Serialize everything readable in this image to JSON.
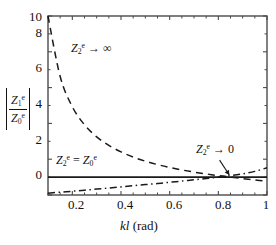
{
  "chart_data": {
    "type": "line",
    "title": "",
    "xlabel": "kl (rad)",
    "ylabel": "|Z_1^e / Z_0^e|",
    "xlim": [
      0.1,
      1.0
    ],
    "ylim": [
      0,
      10
    ],
    "grid": false,
    "legend_position": "inline-annotations",
    "xticks": [
      "0.2",
      "0.4",
      "0.6",
      "0.8",
      "1"
    ],
    "xtick_values": [
      0.2,
      0.4,
      0.6,
      0.8,
      1.0
    ],
    "yticks": [
      "0",
      "2",
      "4",
      "6",
      "8",
      "10"
    ],
    "ytick_values": [
      0,
      2,
      4,
      6,
      8,
      10
    ],
    "x": [
      0.1,
      0.15,
      0.2,
      0.25,
      0.3,
      0.35,
      0.4,
      0.45,
      0.5,
      0.55,
      0.6,
      0.65,
      0.7,
      0.75,
      0.8,
      0.85,
      0.9,
      0.95,
      1.0
    ],
    "series": [
      {
        "name": "Z_2^e -> infinity",
        "style": "dashed",
        "color": "#1a1a1a",
        "values": [
          10.0,
          6.62,
          4.93,
          3.92,
          3.25,
          2.77,
          2.41,
          2.12,
          1.89,
          1.7,
          1.54,
          1.4,
          1.28,
          1.18,
          1.08,
          1.0,
          0.92,
          0.84,
          0.76
        ]
      },
      {
        "name": "Z_2^e = Z_0^e",
        "style": "solid",
        "color": "#1a1a1a",
        "values": [
          1.0,
          1.0,
          1.0,
          1.0,
          1.0,
          1.0,
          1.0,
          1.0,
          1.0,
          1.0,
          1.0,
          1.0,
          1.0,
          1.0,
          1.0,
          1.0,
          1.0,
          1.0,
          1.0
        ]
      },
      {
        "name": "Z_2^e -> 0",
        "style": "dashdot",
        "color": "#1a1a1a",
        "values": [
          0.1,
          0.16,
          0.21,
          0.27,
          0.33,
          0.39,
          0.45,
          0.52,
          0.58,
          0.64,
          0.71,
          0.78,
          0.85,
          0.92,
          1.0,
          1.08,
          1.18,
          1.32,
          1.52
        ]
      }
    ],
    "annotations": [
      {
        "id": "annotation-upper",
        "text": "Z_2^e → ∞",
        "x_data": 0.24,
        "y_data": 8.3,
        "leader": false
      },
      {
        "id": "annotation-middle",
        "text": "Z_2^e = Z_0^e",
        "x_data": 0.175,
        "y_data": 1.85,
        "leader": false
      },
      {
        "id": "annotation-right",
        "text": "Z_2^e → 0",
        "x_data": 0.805,
        "y_data": 2.45,
        "leader": true
      }
    ]
  },
  "labels": {
    "ylabel_numerator_base": "Z",
    "ylabel_numerator_sub": "1",
    "ylabel_numerator_sup": "e",
    "ylabel_denominator_base": "Z",
    "ylabel_denominator_sub": "0",
    "ylabel_denominator_sup": "e",
    "xlabel_italic": "kl",
    "xlabel_rest": " (rad)",
    "ytick_0": "0",
    "ytick_2": "2",
    "ytick_4": "4",
    "ytick_6": "6",
    "ytick_8": "8",
    "ytick_10": "10",
    "xtick_02": "0.2",
    "xtick_04": "0.4",
    "xtick_06": "0.6",
    "xtick_08": "0.8",
    "xtick_1": "1",
    "ann_upper_base": "Z",
    "ann_upper_sub": "2",
    "ann_upper_sup": "e",
    "ann_upper_tail": " → ∞",
    "ann_mid_base1": "Z",
    "ann_mid_sub1": "2",
    "ann_mid_sup1": "e",
    "ann_mid_eq": " = ",
    "ann_mid_base2": "Z",
    "ann_mid_sub2": "0",
    "ann_mid_sup2": "e",
    "ann_right_base": "Z",
    "ann_right_sub": "2",
    "ann_right_sup": "e",
    "ann_right_tail": " → 0"
  },
  "style": {
    "axis_color": "#4a4a4a",
    "curve_color": "#1a1a1a",
    "background": "#ffffff"
  }
}
